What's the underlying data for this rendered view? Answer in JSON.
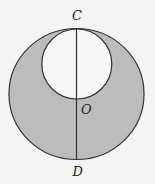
{
  "diagram": {
    "labels": {
      "top": "C",
      "center": "O",
      "bottom": "D"
    },
    "colors": {
      "background": "#f4f4f4",
      "shaded_region": "#bcbcbc",
      "inner_circle_fill": "#f7f7f7",
      "stroke": "#333333"
    },
    "shapes": {
      "outer_circle": {
        "cx": 76.5,
        "cy": 94,
        "r": 66
      },
      "inner_circle": {
        "cx": 76.5,
        "cy": 64,
        "r": 35
      },
      "diameter_line": {
        "x": 76.5,
        "y1": 28,
        "y2": 160
      }
    }
  }
}
